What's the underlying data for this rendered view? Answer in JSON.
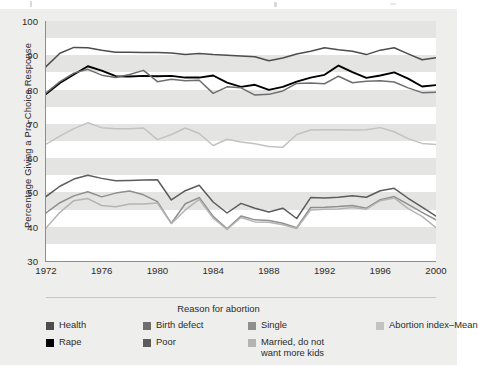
{
  "chart_data": {
    "type": "line",
    "title": "",
    "xlabel": "",
    "ylabel": "Percentage  Giving a Pro-Choice Response",
    "xlim": [
      1972,
      2000
    ],
    "ylim": [
      30,
      100
    ],
    "grid": "alternating horizontal bands",
    "legend_position": "bottom",
    "legend_title": "Reason for abortion",
    "x": [
      1972,
      1973,
      1974,
      1975,
      1976,
      1977,
      1978,
      1979,
      1980,
      1981,
      1982,
      1983,
      1984,
      1985,
      1986,
      1987,
      1988,
      1989,
      1990,
      1991,
      1992,
      1993,
      1994,
      1995,
      1996,
      1997,
      1998,
      1999,
      2000
    ],
    "yticks": [
      30,
      40,
      50,
      60,
      70,
      80,
      90,
      100
    ],
    "xticks": [
      1972,
      1976,
      1980,
      1984,
      1988,
      1992,
      1996,
      2000
    ],
    "series": [
      {
        "name": "Health",
        "color": "#4d4d4d",
        "values": [
          86.7,
          90.6,
          92.3,
          92.2,
          91.5,
          90.9,
          90.9,
          90.8,
          90.8,
          90.7,
          90.2,
          90.5,
          90.2,
          90.0,
          89.8,
          89.6,
          88.4,
          89.2,
          90.4,
          91.2,
          92.2,
          91.6,
          91.2,
          90.2,
          91.5,
          92.2,
          90.4,
          88.7,
          89.3
        ]
      },
      {
        "name": "Rape",
        "color": "#000000",
        "values": [
          78.7,
          81.9,
          84.4,
          86.8,
          85.5,
          83.9,
          83.8,
          84.0,
          83.9,
          84.0,
          83.5,
          83.5,
          84.1,
          82.0,
          80.8,
          81.4,
          79.9,
          80.8,
          82.3,
          83.5,
          84.3,
          87.0,
          85.1,
          83.4,
          84.1,
          85.0,
          83.2,
          80.9,
          81.3
        ]
      },
      {
        "name": "Birth defect",
        "color": "#6e6e6e",
        "values": [
          79.0,
          82.3,
          84.8,
          85.9,
          84.2,
          83.5,
          84.4,
          85.6,
          82.3,
          83.0,
          82.6,
          82.7,
          78.9,
          80.8,
          80.5,
          78.4,
          78.6,
          79.6,
          81.8,
          81.9,
          81.7,
          83.9,
          82.0,
          82.4,
          82.6,
          82.2,
          80.5,
          79.1,
          79.2
        ]
      },
      {
        "name": "Abortion index-Mean",
        "color": "#c2c2c0",
        "values": [
          64.1,
          66.4,
          68.6,
          70.3,
          68.9,
          68.6,
          68.6,
          68.8,
          65.4,
          66.9,
          68.8,
          67.2,
          63.7,
          65.5,
          64.7,
          64.2,
          63.4,
          63.2,
          66.9,
          68.2,
          68.3,
          68.3,
          68.2,
          68.3,
          68.9,
          67.7,
          65.7,
          64.3,
          64.0
        ]
      },
      {
        "name": "Poor",
        "color": "#5c5c5c",
        "values": [
          48.8,
          51.8,
          53.9,
          55.0,
          54.1,
          53.4,
          53.5,
          53.6,
          53.7,
          47.8,
          50.5,
          52.1,
          47.2,
          44.0,
          46.8,
          45.4,
          44.3,
          45.4,
          42.4,
          48.5,
          48.4,
          48.6,
          49.0,
          48.6,
          50.5,
          51.2,
          48.3,
          45.7,
          43.1
        ]
      },
      {
        "name": "Single",
        "color": "#8f8f8f",
        "values": [
          44.0,
          47.0,
          49.0,
          50.2,
          48.7,
          49.8,
          50.4,
          49.3,
          47.3,
          41.0,
          46.7,
          48.5,
          43.0,
          39.4,
          43.1,
          42.0,
          41.8,
          41.0,
          39.7,
          45.6,
          45.7,
          45.9,
          46.2,
          45.4,
          47.9,
          48.8,
          46.5,
          44.2,
          42.0
        ]
      },
      {
        "name": "Married, do not want more kids",
        "color": "#b4b4b2",
        "values": [
          39.6,
          44.2,
          47.6,
          48.2,
          46.2,
          45.8,
          46.6,
          46.6,
          46.9,
          40.9,
          44.9,
          48.0,
          42.5,
          39.2,
          42.7,
          41.4,
          41.3,
          40.6,
          39.5,
          44.9,
          45.1,
          45.2,
          45.6,
          45.1,
          47.6,
          48.4,
          45.3,
          43.0,
          39.7
        ]
      }
    ]
  },
  "axis": {
    "y_title": "Percentage  Giving a Pro-Choice Response",
    "y_ticks": [
      "100",
      "90",
      "80",
      "70",
      "60",
      "50",
      "40",
      "30"
    ],
    "x_ticks": [
      "1972",
      "1976",
      "1980",
      "1984",
      "1988",
      "1992",
      "1996",
      "2000"
    ]
  },
  "legend": {
    "title": "Reason for abortion",
    "columns": [
      [
        {
          "label": "Health",
          "label2": "",
          "color": "#4d4d4d"
        },
        {
          "label": "Rape",
          "label2": "",
          "color": "#000000"
        }
      ],
      [
        {
          "label": "Birth defect",
          "label2": "",
          "color": "#6e6e6e"
        },
        {
          "label": "Poor",
          "label2": "",
          "color": "#5c5c5c"
        }
      ],
      [
        {
          "label": "Single",
          "label2": "",
          "color": "#8f8f8f"
        },
        {
          "label": "Married, do not",
          "label2": "want more kids",
          "color": "#b4b4b2"
        }
      ],
      [
        {
          "label": "Abortion index–Mean",
          "label2": "",
          "color": "#c2c2c0"
        }
      ]
    ]
  }
}
